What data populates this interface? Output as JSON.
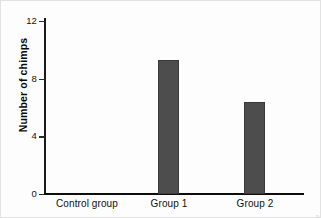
{
  "chart_data": {
    "type": "bar",
    "title": "",
    "subtitle": "",
    "xlabel": "",
    "ylabel": "Number of chimps",
    "categories": [
      "Control group",
      "Group 1",
      "Group 2"
    ],
    "values": [
      0,
      9.3,
      6.4
    ],
    "series": [
      {
        "name": "Number of chimps",
        "values": [
          0,
          9.3,
          6.4
        ]
      }
    ],
    "ylim": [
      0,
      12
    ],
    "yticks": [
      0,
      4,
      8,
      12
    ],
    "ytick_labels": [
      "0",
      "4",
      "8",
      "12"
    ],
    "grid": false,
    "legend": false,
    "legend_position": "none",
    "bar_color": "#4d4d4d",
    "bar_edge_color": "#3a3a3a",
    "axis_color": "#0d0d0d",
    "background_color": "#ffffff",
    "annotations": []
  },
  "figure": {
    "credit": "© Cengage Learning"
  }
}
